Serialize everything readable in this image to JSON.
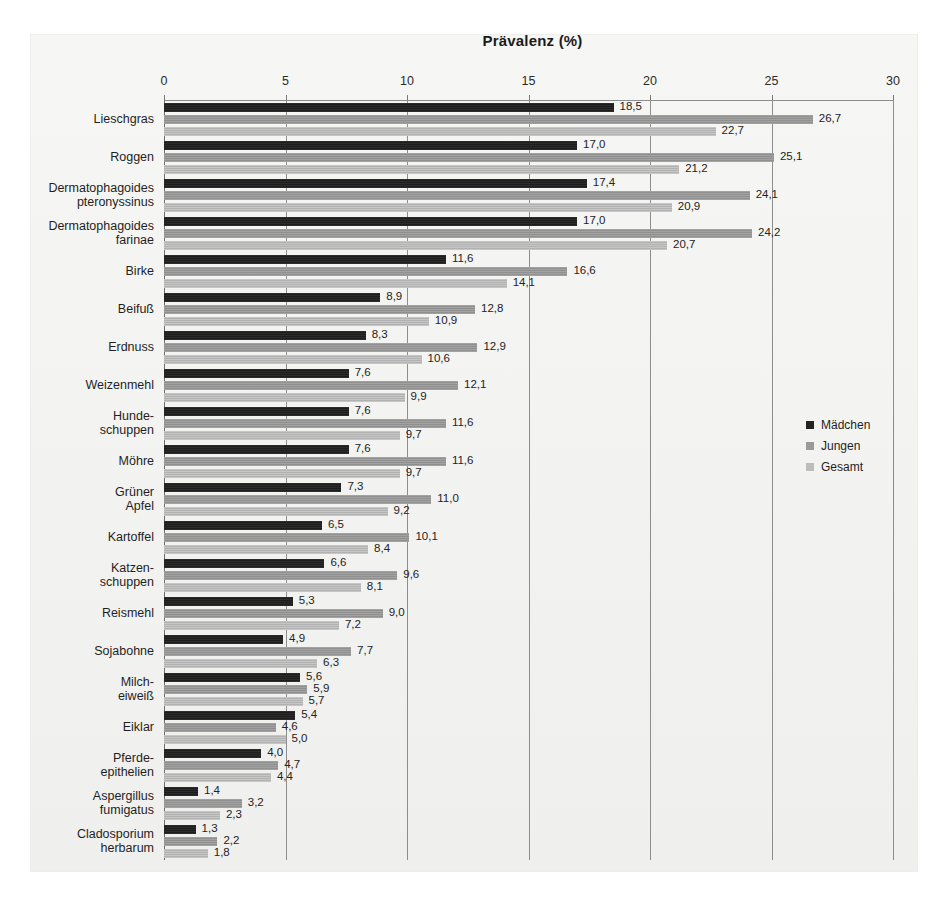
{
  "chart_data": {
    "type": "bar",
    "orientation": "horizontal",
    "title": "Prävalenz (%)",
    "xlabel": "",
    "ylabel": "",
    "xlim": [
      0,
      30
    ],
    "xticks": [
      0,
      5,
      10,
      15,
      20,
      25,
      30
    ],
    "xtick_labels": [
      "0",
      "5",
      "10",
      "15",
      "20",
      "25",
      "30"
    ],
    "grid": true,
    "legend_position": "right",
    "decimal_separator": ",",
    "series": [
      {
        "name": "Mädchen",
        "color": "#262626",
        "values": [
          18.5,
          17.0,
          17.4,
          17.0,
          11.6,
          8.9,
          8.3,
          7.6,
          7.6,
          7.6,
          7.3,
          6.5,
          6.6,
          5.3,
          4.9,
          5.6,
          5.4,
          4.0,
          1.4,
          1.3
        ]
      },
      {
        "name": "Jungen",
        "color": "#9a9a9a",
        "values": [
          26.7,
          25.1,
          24.1,
          24.2,
          16.6,
          12.8,
          12.9,
          12.1,
          11.6,
          11.6,
          11.0,
          10.1,
          9.6,
          9.0,
          7.7,
          5.9,
          4.6,
          4.7,
          3.2,
          2.2
        ]
      },
      {
        "name": "Gesamt",
        "color": "#bdbdbd",
        "values": [
          22.7,
          21.2,
          20.9,
          20.7,
          14.1,
          10.9,
          10.6,
          9.9,
          9.7,
          9.7,
          9.2,
          8.4,
          8.1,
          7.2,
          6.3,
          5.7,
          5.0,
          4.4,
          2.3,
          1.8
        ]
      }
    ],
    "categories": [
      "Lieschgras",
      "Roggen",
      "Dermatophagoides\npteronyssinus",
      "Dermatophagoides\nfarinae",
      "Birke",
      "Beifuß",
      "Erdnuss",
      "Weizenmehl",
      "Hunde-\nschuppen",
      "Möhre",
      "Grüner\nApfel",
      "Kartoffel",
      "Katzen-\nschuppen",
      "Reismehl",
      "Sojabohne",
      "Milch-\neiweiß",
      "Eiklar",
      "Pferde-\nepithelien",
      "Aspergillus\nfumigatus",
      "Cladosporium\nherbarum"
    ],
    "value_labels": [
      [
        "18,5",
        "26,7",
        "22,7"
      ],
      [
        "17,0",
        "25,1",
        "21,2"
      ],
      [
        "17,4",
        "24,1",
        "20,9"
      ],
      [
        "17,0",
        "24,2",
        "20,7"
      ],
      [
        "11,6",
        "16,6",
        "14,1"
      ],
      [
        "8,9",
        "12,8",
        "10,9"
      ],
      [
        "8,3",
        "12,9",
        "10,6"
      ],
      [
        "7,6",
        "12,1",
        "9,9"
      ],
      [
        "7,6",
        "11,6",
        "9,7"
      ],
      [
        "7,6",
        "11,6",
        "9,7"
      ],
      [
        "7,3",
        "11,0",
        "9,2"
      ],
      [
        "6,5",
        "10,1",
        "8,4"
      ],
      [
        "6,6",
        "9,6",
        "8,1"
      ],
      [
        "5,3",
        "9,0",
        "7,2"
      ],
      [
        "4,9",
        "7,7",
        "6,3"
      ],
      [
        "5,6",
        "5,9",
        "5,7"
      ],
      [
        "5,4",
        "4,6",
        "5,0"
      ],
      [
        "4,0",
        "4,7",
        "4,4"
      ],
      [
        "1,4",
        "3,2",
        "2,3"
      ],
      [
        "1,3",
        "2,2",
        "1,8"
      ]
    ]
  }
}
